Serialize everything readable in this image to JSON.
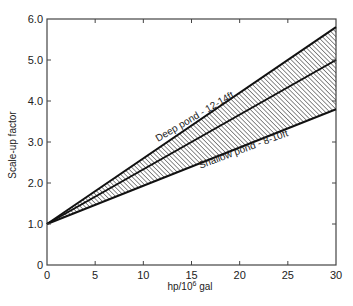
{
  "chart_data": {
    "type": "line",
    "title": "",
    "xlabel": "hp/10",
    "xlabel_sup": "6",
    "xlabel_suffix": " gal",
    "ylabel": "Scale-up factor",
    "xlim": [
      0,
      30
    ],
    "ylim": [
      0,
      6.0
    ],
    "xticks": [
      0,
      5,
      10,
      15,
      20,
      25,
      30
    ],
    "xtick_labels": [
      "0",
      "5",
      "10",
      "15",
      "20",
      "25",
      "30"
    ],
    "yticks": [
      0,
      1,
      2,
      3,
      4,
      5,
      6
    ],
    "ytick_labels": [
      "0",
      "1.0",
      "2.0",
      "3.0",
      "4.0",
      "5.0",
      "6.0"
    ],
    "grid": false,
    "legend": "none",
    "series": [
      {
        "name": "Deep pond - 12-14ft (upper bound)",
        "x": [
          0,
          30
        ],
        "y": [
          1.0,
          5.8
        ]
      },
      {
        "name": "Middle line",
        "x": [
          0,
          30
        ],
        "y": [
          1.0,
          5.0
        ]
      },
      {
        "name": "Shallow pond - 8-10ft (lower bound)",
        "x": [
          0,
          30
        ],
        "y": [
          1.0,
          3.8
        ]
      }
    ],
    "shaded_region": {
      "between": [
        "Deep pond - 12-14ft (upper bound)",
        "Shallow pond - 8-10ft (lower bound)"
      ],
      "pattern": "diagonal-hatch"
    },
    "annotations": [
      {
        "text": "Deep pond - 12-14ft",
        "x": 15.5,
        "y": 3.55,
        "angle": -30.5
      },
      {
        "text": "Shallow pond - 8-10ft",
        "x": 20.5,
        "y": 2.75,
        "angle": -20.5
      }
    ]
  },
  "colors": {
    "line": "#111111",
    "hatch": "#333333",
    "axis": "#444444",
    "text": "#222222"
  }
}
